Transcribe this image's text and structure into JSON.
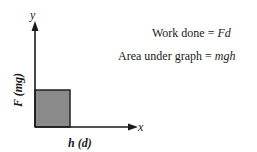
{
  "diagram": {
    "axes": {
      "y_axis_label": "y",
      "x_axis_label": "x",
      "vertical_quantity": {
        "symbol": "F",
        "paren": "(mg)"
      },
      "horizontal_quantity": {
        "symbol": "h",
        "paren": "(d)"
      }
    },
    "shaded_region": {
      "fill": "#8a8a8a",
      "stroke": "#222222"
    },
    "equations": {
      "work_done": {
        "label": "Work done = ",
        "expr": "Fd"
      },
      "area": {
        "label": "Area under graph = ",
        "expr": "mgh"
      }
    },
    "colors": {
      "axis": "#1a1a1a",
      "text": "#1a1a1a",
      "background": "#ffffff"
    }
  }
}
